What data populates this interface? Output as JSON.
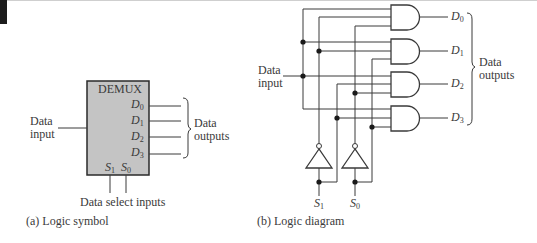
{
  "symbol": {
    "block_title": "DEMUX",
    "outputs": [
      "D",
      "D",
      "D",
      "D"
    ],
    "output_subs": [
      "0",
      "1",
      "2",
      "3"
    ],
    "selects": [
      "S",
      "S"
    ],
    "select_subs": [
      "1",
      "0"
    ],
    "data_input_label_1": "Data",
    "data_input_label_2": "input",
    "data_outputs_label_1": "Data",
    "data_outputs_label_2": "outputs",
    "select_label": "Data select inputs",
    "caption": "(a) Logic symbol",
    "block_fill": "#c4c4c4"
  },
  "diagram": {
    "data_input_label_1": "Data",
    "data_input_label_2": "input",
    "outputs": [
      "D",
      "D",
      "D",
      "D"
    ],
    "output_subs": [
      "0",
      "1",
      "2",
      "3"
    ],
    "data_outputs_label_1": "Data",
    "data_outputs_label_2": "outputs",
    "selects": [
      "S",
      "S"
    ],
    "select_subs": [
      "1",
      "0"
    ],
    "caption": "(b) Logic diagram",
    "gates": [
      "AND",
      "AND",
      "AND",
      "AND"
    ],
    "inverters": [
      "NOT",
      "NOT"
    ]
  }
}
